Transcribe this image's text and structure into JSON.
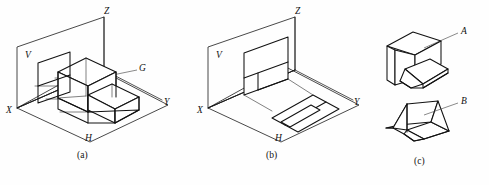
{
  "figure": {
    "background_color": "#fefefe",
    "line_color": "#121212",
    "panels": [
      {
        "id": "a",
        "caption": "(a)",
        "caption_x": 78,
        "caption_y": 153,
        "description": "Solid object positioned inside the two-plane projection system",
        "axis_labels": [
          {
            "text": "Z",
            "x": 104,
            "y": 8
          },
          {
            "text": "V",
            "x": 25,
            "y": 56
          },
          {
            "text": "X",
            "x": 8,
            "y": 111
          },
          {
            "text": "Y",
            "x": 165,
            "y": 107
          },
          {
            "text": "G",
            "x": 140,
            "y": 69
          },
          {
            "text": "H",
            "x": 86,
            "y": 135
          }
        ]
      },
      {
        "id": "b",
        "caption": "(b)",
        "caption_x": 267,
        "caption_y": 153,
        "description": "Resulting front view on V plane and top view on H plane",
        "axis_labels": [
          {
            "text": "Z",
            "x": 295,
            "y": 8
          },
          {
            "text": "V",
            "x": 217,
            "y": 56
          },
          {
            "text": "X",
            "x": 199,
            "y": 111
          },
          {
            "text": "Y",
            "x": 353,
            "y": 107
          },
          {
            "text": "H",
            "x": 276,
            "y": 135
          }
        ]
      },
      {
        "id": "c",
        "caption": "(c)",
        "caption_x": 415,
        "caption_y": 159,
        "description": "Two candidate solids matching the given views",
        "axis_labels": [
          {
            "text": "A",
            "x": 461,
            "y": 31
          },
          {
            "text": "B",
            "x": 461,
            "y": 101
          }
        ]
      }
    ]
  }
}
